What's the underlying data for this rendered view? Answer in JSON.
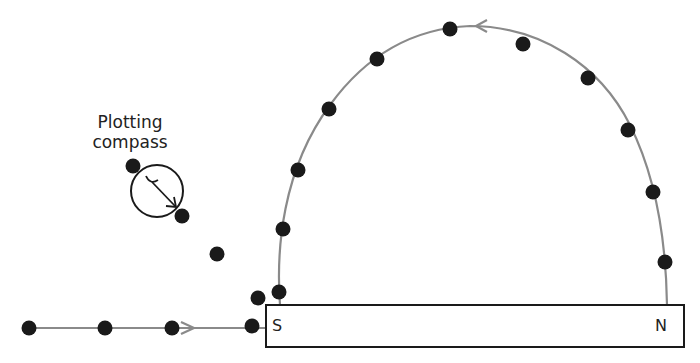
{
  "labels": {
    "compass_line1": "Plotting",
    "compass_line2": "compass",
    "south_pole": "S",
    "north_pole": "N"
  },
  "colors": {
    "field_line": "#8a8a8a",
    "dot": "#1a1a1a",
    "outline": "#1a1a1a"
  },
  "magnet": {
    "x": 266,
    "y": 305,
    "width": 418,
    "height": 42
  },
  "dots": [
    [
      29,
      328
    ],
    [
      105,
      328
    ],
    [
      172,
      328
    ],
    [
      252,
      326
    ],
    [
      258,
      298
    ],
    [
      279,
      292
    ],
    [
      217,
      254
    ],
    [
      182,
      216
    ],
    [
      133,
      166
    ],
    [
      283,
      229
    ],
    [
      298,
      170
    ],
    [
      329,
      109
    ],
    [
      377,
      59
    ],
    [
      450,
      29
    ],
    [
      523,
      44
    ],
    [
      588,
      78
    ],
    [
      628,
      130
    ],
    [
      653,
      192
    ],
    [
      665,
      262
    ]
  ]
}
